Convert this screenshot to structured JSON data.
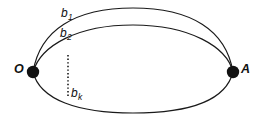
{
  "figure": {
    "type": "geometric-diagram",
    "background_color": "#ffffff",
    "stroke_color": "#1a1a1a",
    "vertices": [
      {
        "id": "O",
        "label": "O",
        "x": 33,
        "y": 72
      },
      {
        "id": "A",
        "label": "A",
        "x": 233,
        "y": 72
      }
    ],
    "curves": [
      {
        "id": "b1",
        "label": "b",
        "subscript": "1",
        "role": "outer-upper-arc"
      },
      {
        "id": "b2",
        "label": "b",
        "subscript": "2",
        "role": "inner-upper-arc"
      },
      {
        "id": "bottom",
        "label": "",
        "subscript": "",
        "role": "lower-arc"
      }
    ],
    "chord": {
      "id": "bk",
      "label": "b",
      "subscript": "k",
      "style": "dotted",
      "x": 68,
      "y_top": 55,
      "y_bottom": 96
    },
    "labels": {
      "point_O": "O",
      "point_A": "A",
      "curve_b1_base": "b",
      "curve_b1_sub": "1",
      "curve_b2_base": "b",
      "curve_b2_sub": "2",
      "chord_bk_base": "b",
      "chord_bk_sub": "k"
    }
  }
}
